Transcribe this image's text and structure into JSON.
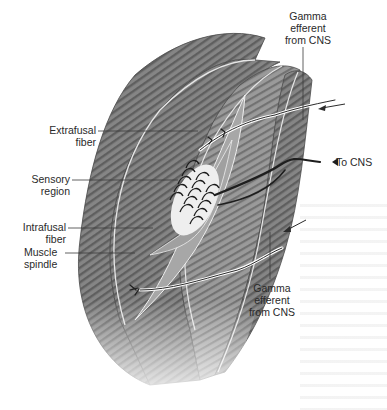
{
  "figure": {
    "subject": "Muscle spindle",
    "colors": {
      "muscle_dark": "#6e6e6e",
      "muscle_mid": "#8f8f8f",
      "muscle_light": "#b8b8b8",
      "tendon": "#d9d9d9",
      "nerve": "#1e1e1e",
      "sensory_region": "#efefef",
      "leader_line": "#3a3a3a"
    }
  },
  "labels": {
    "gamma_top": {
      "line1": "Gamma",
      "line2": "efferent",
      "line3": "from CNS"
    },
    "extrafusal": {
      "line1": "Extrafusal",
      "line2": "fiber"
    },
    "to_cns": "To CNS",
    "sensory": {
      "line1": "Sensory",
      "line2": "region"
    },
    "intrafusal": {
      "line1": "Intrafusal",
      "line2": "fiber"
    },
    "spindle": {
      "line1": "Muscle",
      "line2": "spindle"
    },
    "gamma_bottom": {
      "line1": "Gamma",
      "line2": "efferent",
      "line3": "from CNS"
    }
  }
}
